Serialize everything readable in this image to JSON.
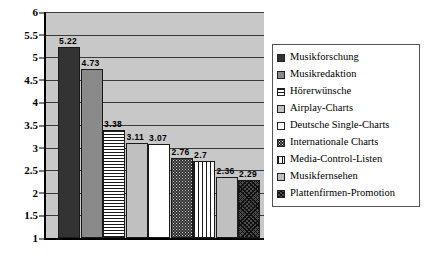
{
  "chart_data": {
    "type": "bar",
    "title": "",
    "subtitle": "",
    "xlabel": "",
    "ylabel": "",
    "ylim": [
      1,
      6
    ],
    "grid": true,
    "legend_position": "right",
    "categories": [
      "Musikforschung",
      "Musikredaktion",
      "Hörerwünsche",
      "Airplay-Charts",
      "Deutsche Single-Charts",
      "Internationale Charts",
      "Media-Control-Listen",
      "Musikfernsehen",
      "Plattenfirmen-Promotion"
    ],
    "values": [
      5.22,
      4.73,
      3.38,
      3.11,
      3.07,
      2.76,
      2.7,
      2.36,
      2.29
    ],
    "value_labels": [
      "5.22",
      "4.73",
      "3.38",
      "3.11",
      "3.07",
      "2.76",
      "2.7",
      "2.36",
      "2.29"
    ],
    "ytick_labels": [
      "6",
      "5.5",
      "5",
      "4.5",
      "4",
      "3.5",
      "3",
      "2.5",
      "2",
      "1.5",
      "1"
    ],
    "ytick_values": [
      6,
      5.5,
      5,
      4.5,
      4,
      3.5,
      3,
      2.5,
      2,
      1.5,
      1
    ],
    "series_fills": [
      "dark-solid",
      "medium-gray-solid",
      "horizontal-stripes",
      "light-gray-solid",
      "white-solid",
      "dark-dotted",
      "vertical-stripes",
      "light-gray-solid",
      "diagonal-crosshatch"
    ],
    "plot_background": "#c8c8c8",
    "axis_color": "#000000",
    "gridline_color": "#3a3a3a"
  },
  "legend": {
    "items": [
      {
        "label": "Musikforschung",
        "fill": "dark-solid"
      },
      {
        "label": "Musikredaktion",
        "fill": "medium-gray-solid"
      },
      {
        "label": "Hörerwünsche",
        "fill": "horizontal-stripes"
      },
      {
        "label": "Airplay-Charts",
        "fill": "light-gray-solid"
      },
      {
        "label": "Deutsche Single-Charts",
        "fill": "white-solid"
      },
      {
        "label": "Internationale Charts",
        "fill": "dark-dotted"
      },
      {
        "label": "Media-Control-Listen",
        "fill": "vertical-stripes"
      },
      {
        "label": "Musikfernsehen",
        "fill": "light-gray-solid"
      },
      {
        "label": "Plattenfirmen-Promotion",
        "fill": "diagonal-crosshatch"
      }
    ]
  }
}
